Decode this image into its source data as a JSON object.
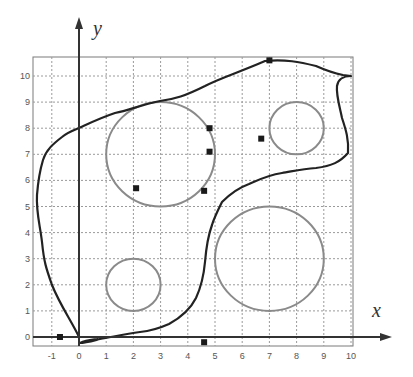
{
  "axes": {
    "x_label": "x",
    "y_label": "y",
    "x_ticks": [
      "-1",
      "0",
      "1",
      "2",
      "3",
      "4",
      "5",
      "6",
      "7",
      "8",
      "9",
      "10"
    ],
    "y_ticks": [
      "0",
      "1",
      "2",
      "3",
      "4",
      "5",
      "6",
      "7",
      "8",
      "9",
      "10"
    ],
    "x_range": [
      -1.7,
      10
    ],
    "y_range": [
      -0.3,
      10.7
    ]
  },
  "circles": [
    {
      "id": "circle-1",
      "cx": 3,
      "cy": 7,
      "r": 2
    },
    {
      "id": "circle-2",
      "cx": 8,
      "cy": 8,
      "r": 1
    },
    {
      "id": "circle-3",
      "cx": 7,
      "cy": 3,
      "r": 2
    },
    {
      "id": "circle-4",
      "cx": 2,
      "cy": 2,
      "r": 1
    }
  ],
  "points": [
    {
      "x": -0.7,
      "y": 0
    },
    {
      "x": 2.1,
      "y": 5.7
    },
    {
      "x": 4.6,
      "y": 5.6
    },
    {
      "x": 4.8,
      "y": 7.1
    },
    {
      "x": 4.8,
      "y": 8.0
    },
    {
      "x": 6.7,
      "y": 7.6
    },
    {
      "x": 7.0,
      "y": 10.6
    },
    {
      "x": 4.6,
      "y": -0.2
    }
  ],
  "colors": {
    "curve": "#222222",
    "circle": "#8a8a8a",
    "grid": "#9a9a9a",
    "axis": "#333333",
    "point": "#1a1a1a"
  }
}
